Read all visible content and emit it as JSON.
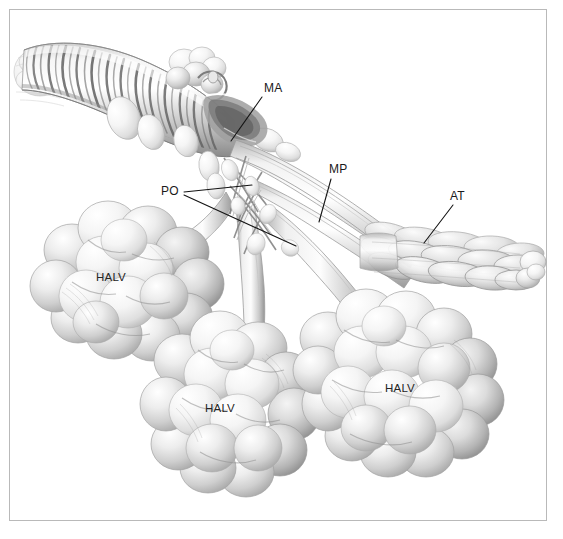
{
  "figure": {
    "domain": "anatomical-illustration",
    "background_color": "#ffffff",
    "frame_color": "#b9b9b9",
    "ink_color": "#1a1a1a",
    "shading_color": "#8d8d8d"
  },
  "labels": [
    {
      "id": "ma",
      "text": "MA",
      "x": 264,
      "y": 82,
      "kind": "leader",
      "leader": {
        "x1": 262,
        "y1": 97,
        "x2": 231,
        "y2": 141
      }
    },
    {
      "id": "mp",
      "text": "MP",
      "x": 329,
      "y": 163,
      "kind": "leader",
      "leader": {
        "x1": 331,
        "y1": 179,
        "x2": 319,
        "y2": 222
      }
    },
    {
      "id": "po",
      "text": "PO",
      "x": 161,
      "y": 185,
      "kind": "leader",
      "leader": {
        "x1": 184,
        "y1": 192,
        "x2": 252,
        "y2": 185
      },
      "leader2": {
        "x1": 184,
        "y1": 195,
        "x2": 296,
        "y2": 246
      }
    },
    {
      "id": "at",
      "text": "AT",
      "x": 450,
      "y": 190,
      "kind": "leader",
      "leader": {
        "x1": 453,
        "y1": 205,
        "x2": 424,
        "y2": 243
      }
    },
    {
      "id": "halv1",
      "text": "HALV",
      "x": 96,
      "y": 272,
      "kind": "on-structure"
    },
    {
      "id": "halv2",
      "text": "HALV",
      "x": 205,
      "y": 403,
      "kind": "on-structure"
    },
    {
      "id": "halv3",
      "text": "HALV",
      "x": 385,
      "y": 383,
      "kind": "on-structure"
    }
  ],
  "structures": {
    "trachea": {
      "name": "main tracheal trunk",
      "description": "large spirally-banded duct entering from upper left",
      "band_count": 26
    },
    "alveolar_clusters": [
      {
        "name": "HALV cluster left",
        "cx": 128,
        "cy": 275,
        "rx": 92,
        "ry": 78,
        "lobes": 30
      },
      {
        "name": "HALV cluster middle",
        "cx": 235,
        "cy": 395,
        "rx": 82,
        "ry": 92,
        "lobes": 30
      },
      {
        "name": "HALV cluster right",
        "cx": 405,
        "cy": 385,
        "rx": 98,
        "ry": 84,
        "lobes": 32
      }
    ],
    "air_tube_cluster": {
      "name": "AT elongated tubular cluster",
      "cx": 448,
      "cy": 252,
      "rx": 98,
      "ry": 38,
      "tubes": 18
    },
    "branch_tubes": 9
  }
}
